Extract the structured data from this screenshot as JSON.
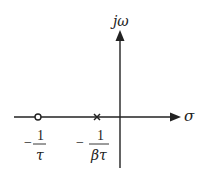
{
  "diagram": {
    "type": "s-plane pole-zero plot",
    "axes": {
      "vertical_label": "jω",
      "horizontal_label": "σ"
    },
    "markers": [
      {
        "kind": "zero",
        "symbol": "o",
        "label_sign": "−",
        "label_num": "1",
        "label_den": "τ"
      },
      {
        "kind": "pole",
        "symbol": "×",
        "label_sign": "−",
        "label_num": "1",
        "label_den": "βτ"
      }
    ],
    "colors": {
      "line": "#222222",
      "background": "#ffffff"
    }
  }
}
